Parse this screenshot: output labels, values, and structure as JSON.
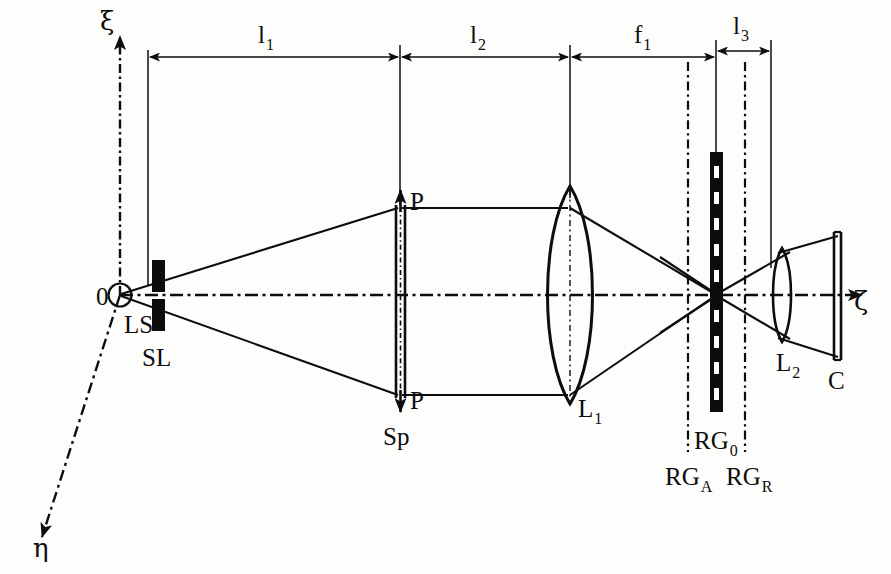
{
  "figure": {
    "type": "optical-system-schematic",
    "title": "",
    "background_color": "#fdfdfb",
    "ink_color": "#0d0d0d"
  },
  "axes": {
    "vertical": {
      "symbol": "ξ",
      "name": "xi-axis",
      "direction": "up",
      "x": 120,
      "y_top": 30,
      "y_bottom": 574
    },
    "horizontal": {
      "symbol": "ζ",
      "name": "zeta-axis",
      "direction": "right",
      "y": 295,
      "x_start": 120,
      "x_end": 873
    },
    "oblique": {
      "symbol": "η",
      "name": "eta-axis",
      "direction": "down-left",
      "x_start": 120,
      "y_start": 295,
      "x_end": 36,
      "y_end": 545
    },
    "origin_label": "0"
  },
  "dimensions": [
    {
      "id": "l1",
      "base": "l",
      "sub": "1",
      "x_start": 148,
      "x_end": 400,
      "label_x": 258,
      "label_y": 22
    },
    {
      "id": "l2",
      "base": "l",
      "sub": "2",
      "x_start": 400,
      "x_end": 570,
      "label_x": 470,
      "label_y": 22
    },
    {
      "id": "f1",
      "base": "f",
      "sub": "1",
      "x_start": 570,
      "x_end": 716,
      "label_x": 634,
      "label_y": 22
    },
    {
      "id": "l3",
      "base": "l",
      "sub": "3",
      "x_start": 716,
      "x_end": 771,
      "label_x": 733,
      "label_y": 16
    }
  ],
  "dimension_line_y": 57,
  "components": [
    {
      "id": "LS",
      "label": "LS",
      "sub": "",
      "name": "light-source",
      "x": 120,
      "y": 295,
      "label_x": 124,
      "label_y": 312
    },
    {
      "id": "SL",
      "label": "SL",
      "sub": "",
      "name": "slit",
      "x": 158,
      "y": 295,
      "label_x": 142,
      "label_y": 345
    },
    {
      "id": "Sp",
      "label": "Sp",
      "sub": "",
      "name": "sample-plate",
      "x": 400,
      "y": 295,
      "label_x": 385,
      "label_y": 424
    },
    {
      "id": "L1",
      "label": "L",
      "sub": "1",
      "name": "lens-1",
      "x": 570,
      "y": 295,
      "label_x": 578,
      "label_y": 395
    },
    {
      "id": "RG0",
      "label": "RG",
      "sub": "0",
      "name": "reference-grating",
      "x": 716,
      "y": 295,
      "label_x": 697,
      "label_y": 430
    },
    {
      "id": "RGA",
      "label": "RG",
      "sub": "A",
      "name": "grating-plane-a",
      "x": 688,
      "y": 295,
      "label_x": 668,
      "label_y": 466
    },
    {
      "id": "RGR",
      "label": "RG",
      "sub": "R",
      "name": "grating-plane-r",
      "x": 745,
      "y": 295,
      "label_x": 727,
      "label_y": 466
    },
    {
      "id": "L2",
      "label": "L",
      "sub": "2",
      "name": "lens-2",
      "x": 782,
      "y": 295,
      "label_x": 777,
      "label_y": 352
    },
    {
      "id": "C",
      "label": "C",
      "sub": "",
      "name": "camera-screen",
      "x": 838,
      "y": 295,
      "label_x": 828,
      "label_y": 370
    }
  ],
  "polarization_markers": [
    {
      "label": "P",
      "name": "polarization-up",
      "x": 410,
      "y": 192,
      "arrow": "up"
    },
    {
      "label": "P",
      "name": "polarization-down",
      "x": 410,
      "y": 390,
      "arrow": "down"
    }
  ],
  "ray_bundle": {
    "description": "light diverges from LS through SL to Sp edges, travels parallel to L1, converges to focus at RG0, diverges to L2 and C",
    "sp_top_y": 208,
    "sp_bottom_y": 395,
    "focus_x": 716,
    "focus_y": 295,
    "c_top_y": 236,
    "c_bottom_y": 357
  }
}
